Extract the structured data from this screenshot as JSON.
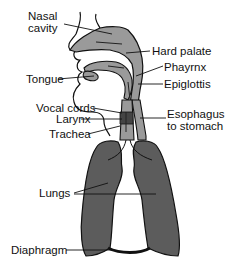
{
  "diagram": {
    "colors": {
      "airway_fill": "#9a9a9a",
      "lung_fill": "#5c5c5c",
      "outline": "#111111",
      "diaphragm": "#111111",
      "background": "#ffffff"
    },
    "labels": {
      "nasal_cavity": "Nasal\ncavity",
      "hard_palate": "Hard palate",
      "pharynx": "Phayrnx",
      "tongue": "Tongue",
      "epiglottis": "Epiglottis",
      "vocal_cords": "Vocal cords",
      "larynx": "Larynx",
      "esophagus": "Esophagus\nto stomach",
      "trachea": "Trachea",
      "lungs": "Lungs",
      "diaphragm": "Diaphragm"
    }
  }
}
